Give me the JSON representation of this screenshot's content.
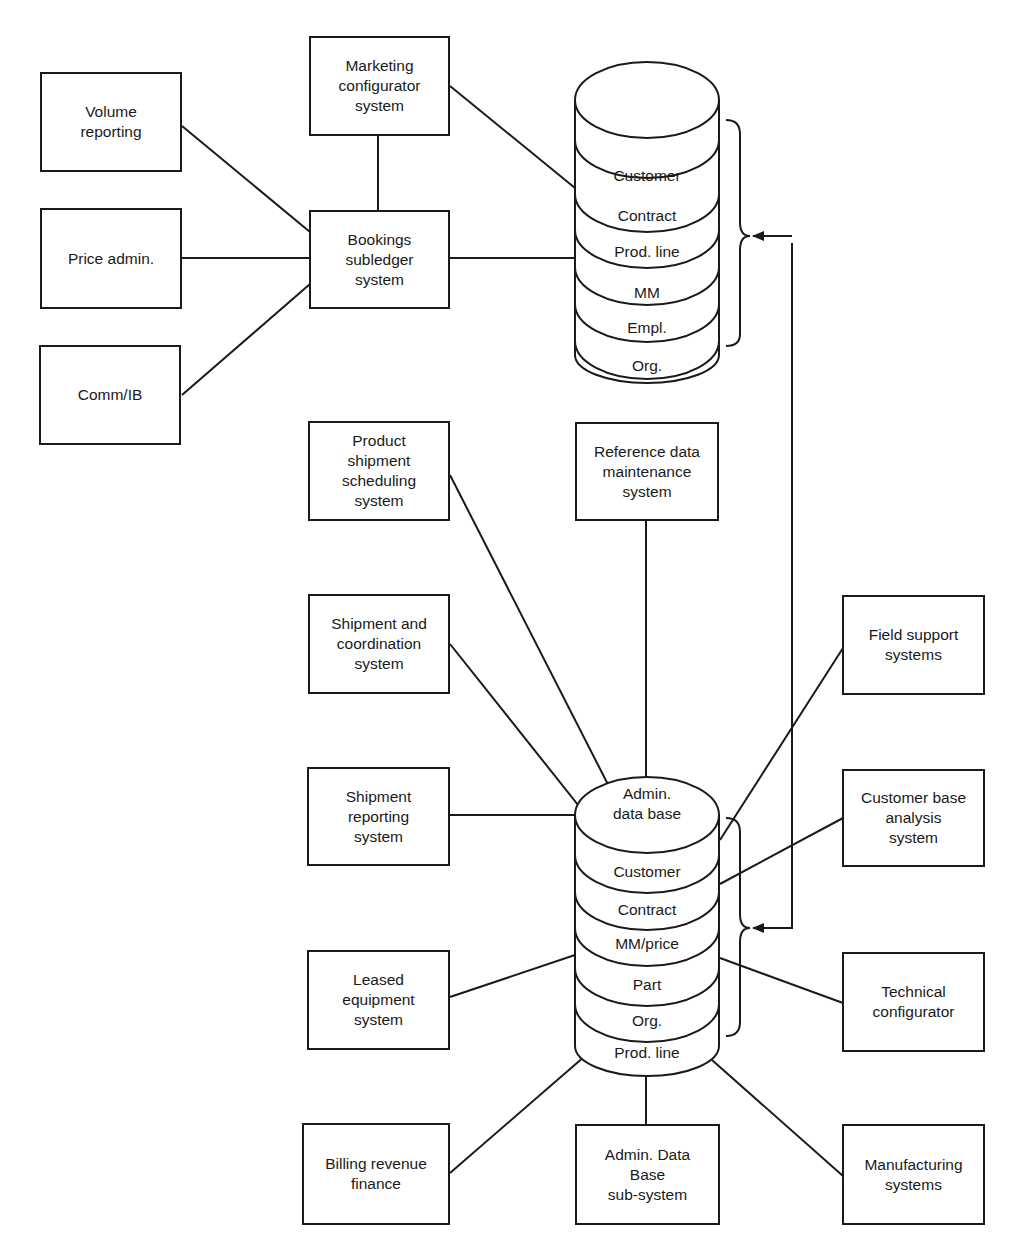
{
  "boxes": {
    "volume_reporting": "Volume\nreporting",
    "price_admin": "Price admin.",
    "comm_ib": "Comm/IB",
    "marketing_configurator": "Marketing\nconfigurator\nsystem",
    "bookings_subledger": "Bookings\nsubledger\nsystem",
    "product_shipment_scheduling": "Product\nshipment\nscheduling\nsystem",
    "reference_data_maintenance": "Reference data\nmaintenance\nsystem",
    "shipment_coordination": "Shipment and\ncoordination\nsystem",
    "field_support": "Field support\nsystems",
    "shipment_reporting": "Shipment\nreporting\nsystem",
    "customer_base_analysis": "Customer base\nanalysis\nsystem",
    "leased_equipment": "Leased\nequipment\nsystem",
    "technical_configurator": "Technical\nconfigurator",
    "billing_revenue": "Billing revenue\nfinance",
    "admin_db_subsystem": "Admin. Data\nBase\nsub-system",
    "manufacturing": "Manufacturing\nsystems"
  },
  "top_database": {
    "layers": [
      "Customer",
      "Contract",
      "Prod. line",
      "MM",
      "Empl.",
      "Org."
    ]
  },
  "admin_database": {
    "title": "Admin.\ndata base",
    "layers": [
      "Customer",
      "Contract",
      "MM/price",
      "Part",
      "Org.",
      "Prod. line"
    ]
  },
  "colors": {
    "line": "#1a1a1a",
    "background": "#ffffff"
  }
}
